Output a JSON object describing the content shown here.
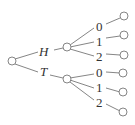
{
  "diagram": {
    "type": "tree",
    "root": {
      "id": "root"
    },
    "level1": [
      {
        "id": "H",
        "label": "H"
      },
      {
        "id": "T",
        "label": "T"
      }
    ],
    "level2": {
      "H": [
        {
          "label": "0"
        },
        {
          "label": "1"
        },
        {
          "label": "2"
        }
      ],
      "T": [
        {
          "label": "0"
        },
        {
          "label": "1"
        },
        {
          "label": "2"
        }
      ]
    }
  }
}
